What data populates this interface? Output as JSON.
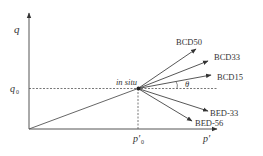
{
  "diagram": {
    "axes": {
      "y_label": "q",
      "x_label": "p′",
      "q0_label": "q",
      "q0_sub": "0",
      "p0_label": "p′",
      "p0_sub": "0"
    },
    "in_situ_label": "in situ",
    "angle_label": "θ",
    "paths": [
      {
        "name": "BCD50",
        "label": "BCD50"
      },
      {
        "name": "BCD33",
        "label": "BCD33"
      },
      {
        "name": "BCD15",
        "label": "BCD15"
      },
      {
        "name": "BED-33",
        "label": "BED-33"
      },
      {
        "name": "BED-56",
        "label": "BED-56"
      }
    ],
    "colors": {
      "line": "#444444",
      "text": "#333333"
    }
  }
}
